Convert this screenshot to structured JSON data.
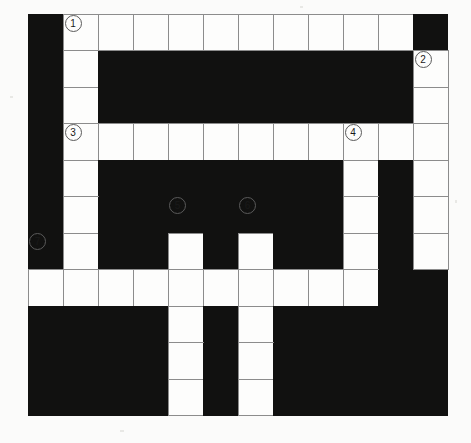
{
  "puzzle": {
    "kind": "crossword-grid",
    "columns": 12,
    "rows": 11,
    "cell_size_px": 35,
    "colors": {
      "block": "#111110",
      "open": "#fdfdfc",
      "grid_line": "#8c8c8c",
      "page": "#ffffff",
      "clue_number_text": "#1a1a1a"
    },
    "legend": {
      "open_symbol": "open",
      "block_symbol": "block"
    },
    "clue_numbers": [
      {
        "label": "1",
        "row": 1,
        "col": 2
      },
      {
        "label": "2",
        "row": 2,
        "col": 12
      },
      {
        "label": "3",
        "row": 4,
        "col": 2
      },
      {
        "label": "4",
        "row": 4,
        "col": 10
      },
      {
        "label": "5",
        "row": 6,
        "col": 5
      },
      {
        "label": "6",
        "row": 6,
        "col": 7
      },
      {
        "label": "7",
        "row": 7,
        "col": 1
      }
    ],
    "grid": [
      [
        "block",
        "open",
        "open",
        "open",
        "open",
        "open",
        "open",
        "open",
        "open",
        "open",
        "open",
        "block"
      ],
      [
        "block",
        "open",
        "block",
        "block",
        "block",
        "block",
        "block",
        "block",
        "block",
        "block",
        "block",
        "open"
      ],
      [
        "block",
        "open",
        "block",
        "block",
        "block",
        "block",
        "block",
        "block",
        "block",
        "block",
        "block",
        "open"
      ],
      [
        "block",
        "open",
        "open",
        "open",
        "open",
        "open",
        "open",
        "open",
        "open",
        "open",
        "open",
        "open"
      ],
      [
        "block",
        "open",
        "block",
        "block",
        "block",
        "block",
        "block",
        "block",
        "block",
        "open",
        "block",
        "open"
      ],
      [
        "block",
        "open",
        "block",
        "block",
        "block",
        "block",
        "block",
        "block",
        "block",
        "open",
        "block",
        "open"
      ],
      [
        "block",
        "open",
        "block",
        "block",
        "open",
        "block",
        "open",
        "block",
        "block",
        "open",
        "block",
        "open"
      ],
      [
        "open",
        "open",
        "open",
        "open",
        "open",
        "open",
        "open",
        "open",
        "open",
        "open",
        "block",
        "block"
      ],
      [
        "block",
        "block",
        "block",
        "block",
        "open",
        "block",
        "open",
        "block",
        "block",
        "block",
        "block",
        "block"
      ],
      [
        "block",
        "block",
        "block",
        "block",
        "open",
        "block",
        "open",
        "block",
        "block",
        "block",
        "block",
        "block"
      ],
      [
        "block",
        "block",
        "block",
        "block",
        "open",
        "block",
        "open",
        "block",
        "block",
        "block",
        "block",
        "block"
      ]
    ]
  }
}
